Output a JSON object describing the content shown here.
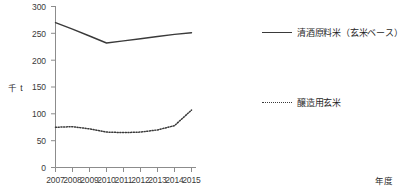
{
  "chart_data": {
    "type": "line",
    "title": "",
    "subtitle": "",
    "xlabel": "年度",
    "ylabel": "千 t",
    "grid": false,
    "legend_position": "right",
    "categories": [
      "2007",
      "2008",
      "2009",
      "2010",
      "2011",
      "2012",
      "2013",
      "2014",
      "2015"
    ],
    "x": [
      2007,
      2008,
      2009,
      2010,
      2011,
      2012,
      2013,
      2014,
      2015
    ],
    "xlim": [
      2006.6,
      2015.4
    ],
    "ylim": [
      0,
      300
    ],
    "yticks": [
      0,
      50,
      100,
      150,
      200,
      250,
      300
    ],
    "series": [
      {
        "name": "清酒原料米（玄米ベース）",
        "style": "solid",
        "color": "#3a3a3a",
        "values": [
          270,
          258,
          245,
          232,
          236,
          240,
          244,
          248,
          251
        ]
      },
      {
        "name": "醸造用玄米",
        "style": "dotted",
        "color": "#3a3a3a",
        "values": [
          75,
          76,
          72,
          66,
          65,
          66,
          70,
          78,
          107
        ]
      }
    ]
  },
  "axes": {
    "y_title": "千 t",
    "x_title": "年度",
    "y_tick_labels": [
      "300",
      "250",
      "200",
      "150",
      "100",
      "50",
      "0"
    ],
    "x_tick_labels": [
      "2007",
      "2008",
      "2009",
      "2010",
      "2011",
      "2012",
      "2013",
      "2014",
      "2015"
    ]
  },
  "legend": {
    "items": [
      {
        "label": "清酒原料米（玄米ベース）",
        "style": "solid"
      },
      {
        "label": "醸造用玄米",
        "style": "dotted"
      }
    ]
  },
  "colors": {
    "line": "#3a3a3a",
    "axis": "#8c8c8c",
    "text": "#2b2b2b",
    "background": "#ffffff"
  }
}
